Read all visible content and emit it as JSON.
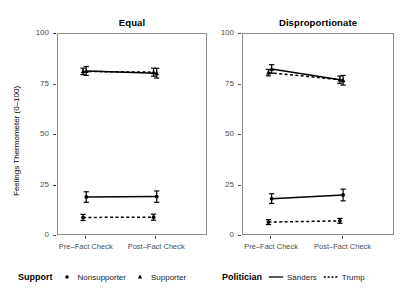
{
  "chart_data": {
    "type": "line",
    "title": "",
    "xlabel": "",
    "ylabel": "Feelings Thermometer (0–100)",
    "x": [
      "Pre–Fact Check",
      "Post–Fact Check"
    ],
    "ylim": [
      0,
      100
    ],
    "yticks": [
      0,
      25,
      50,
      75,
      100
    ],
    "ytick_labels": [
      "0",
      "25",
      "50",
      "75",
      "100"
    ],
    "grid": false,
    "facets": [
      {
        "label": "Equal",
        "series": [
          {
            "name": "Supporter – Sanders",
            "support": "Supporter",
            "politician": "Sanders",
            "marker": "triangle",
            "linetype": "solid",
            "values": [
              81.2,
              80.1
            ],
            "error_low": [
              79.0,
              77.7
            ],
            "error_high": [
              83.4,
              82.5
            ]
          },
          {
            "name": "Supporter – Trump",
            "support": "Supporter",
            "politician": "Trump",
            "marker": "triangle",
            "linetype": "dashed",
            "values": [
              81.0,
              80.6
            ],
            "error_low": [
              79.4,
              78.6
            ],
            "error_high": [
              82.6,
              82.6
            ]
          },
          {
            "name": "Nonsupporter – Sanders",
            "support": "Nonsupporter",
            "politician": "Sanders",
            "marker": "circle",
            "linetype": "solid",
            "values": [
              18.8,
              19.0
            ],
            "error_low": [
              16.2,
              16.2
            ],
            "error_high": [
              21.4,
              21.8
            ]
          },
          {
            "name": "Nonsupporter – Trump",
            "support": "Nonsupporter",
            "politician": "Trump",
            "marker": "circle",
            "linetype": "dashed",
            "values": [
              8.7,
              8.8
            ],
            "error_low": [
              7.2,
              7.3
            ],
            "error_high": [
              10.2,
              10.3
            ]
          }
        ]
      },
      {
        "label": "Disproportionate",
        "series": [
          {
            "name": "Supporter – Sanders",
            "support": "Supporter",
            "politician": "Sanders",
            "marker": "triangle",
            "linetype": "solid",
            "values": [
              82.2,
              76.6
            ],
            "error_low": [
              80.1,
              74.2
            ],
            "error_high": [
              84.3,
              79.0
            ]
          },
          {
            "name": "Supporter – Trump",
            "support": "Supporter",
            "politician": "Trump",
            "marker": "triangle",
            "linetype": "dashed",
            "values": [
              80.4,
              76.9
            ],
            "error_low": [
              78.8,
              75.1
            ],
            "error_high": [
              82.0,
              78.7
            ]
          },
          {
            "name": "Nonsupporter – Sanders",
            "support": "Nonsupporter",
            "politician": "Sanders",
            "marker": "circle",
            "linetype": "solid",
            "values": [
              18.0,
              19.8
            ],
            "error_low": [
              15.6,
              16.9
            ],
            "error_high": [
              20.4,
              22.7
            ]
          },
          {
            "name": "Nonsupporter – Trump",
            "support": "Nonsupporter",
            "politician": "Trump",
            "marker": "circle",
            "linetype": "dashed",
            "values": [
              6.4,
              7.0
            ],
            "error_low": [
              5.2,
              5.8
            ],
            "error_high": [
              7.6,
              8.2
            ]
          }
        ]
      }
    ],
    "legends": [
      {
        "title": "Support",
        "position": "bottom-left",
        "entries": [
          {
            "label": "Nonsupporter",
            "key": "circle-marker"
          },
          {
            "label": "Supporter",
            "key": "triangle-marker"
          }
        ]
      },
      {
        "title": "Politician",
        "position": "bottom-right",
        "entries": [
          {
            "label": "Sanders",
            "key": "solid-line"
          },
          {
            "label": "Trump",
            "key": "dashed-line"
          }
        ]
      }
    ],
    "colors": {
      "series": "#000000",
      "panel_border": "#8c8c8c",
      "tick_text": "#4d4d4d",
      "background": "#ffffff"
    }
  }
}
